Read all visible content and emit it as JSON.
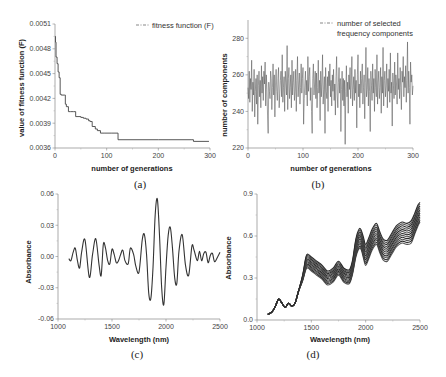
{
  "chart_data": [
    {
      "id": "a",
      "type": "line",
      "caption": "(a)",
      "xlabel": "number of generations",
      "ylabel": "value of fitness function (F)",
      "legend": "fitness function (F)",
      "xlim": [
        0,
        300
      ],
      "ylim": [
        0.0036,
        0.0051
      ],
      "xticks": [
        0,
        100,
        200,
        300
      ],
      "yticks": [
        0.0036,
        0.0039,
        0.0042,
        0.0045,
        0.0048,
        0.0051
      ],
      "ytick_labels": [
        "0.0036",
        "0.0039",
        "0.0042",
        "0.0045",
        "0.0048",
        "0.0051"
      ],
      "x": [
        0,
        1,
        2,
        4,
        6,
        8,
        10,
        12,
        18,
        20,
        22,
        26,
        30,
        36,
        40,
        50,
        55,
        60,
        65,
        68,
        72,
        78,
        82,
        88,
        95,
        110,
        120,
        122,
        200,
        265,
        268,
        298
      ],
      "y": [
        0.00495,
        0.00488,
        0.0047,
        0.00462,
        0.00452,
        0.00445,
        0.00425,
        0.00424,
        0.00424,
        0.00413,
        0.0041,
        0.00404,
        0.00404,
        0.00404,
        0.00398,
        0.00397,
        0.00396,
        0.00395,
        0.00393,
        0.00392,
        0.00386,
        0.00383,
        0.00381,
        0.00378,
        0.00378,
        0.00378,
        0.00378,
        0.0037,
        0.0037,
        0.0037,
        0.00368,
        0.00368
      ],
      "step": true,
      "grid": false,
      "legend_position": "upper right"
    },
    {
      "id": "b",
      "type": "line",
      "caption": "(b)",
      "xlabel": "number of generations",
      "ylabel": "number of components",
      "legend": "number of selected frequency components",
      "legend_lines": [
        "number of selected",
        "frequency components"
      ],
      "xlim": [
        0,
        300
      ],
      "ylim": [
        220,
        290
      ],
      "xticks": [
        0,
        100,
        200,
        300
      ],
      "yticks": [
        220,
        240,
        260,
        280
      ],
      "x_range": [
        0,
        300
      ],
      "y_range_observed": [
        222,
        278
      ],
      "mean_approx": 252,
      "values": [
        253,
        247,
        262,
        245,
        258,
        252,
        268,
        240,
        256,
        249,
        263,
        237,
        251,
        258,
        244,
        260,
        233,
        254,
        262,
        248,
        257,
        242,
        265,
        250,
        259,
        246,
        262,
        255,
        267,
        243,
        260,
        252,
        238,
        228,
        256,
        251,
        247,
        262,
        258,
        241,
        253,
        266,
        249,
        260,
        237,
        255,
        263,
        251,
        246,
        258,
        264,
        242,
        250,
        257,
        262,
        248,
        271,
        245,
        253,
        259,
        240,
        262,
        256,
        249,
        276,
        241,
        258,
        264,
        247,
        253,
        260,
        242,
        268,
        249,
        256,
        262,
        246,
        251,
        263,
        240,
        257,
        270,
        248,
        255,
        261,
        244,
        253,
        266,
        250,
        258,
        264,
        233,
        247,
        255,
        262,
        249,
        257,
        243,
        270,
        251,
        259,
        264,
        246,
        253,
        240,
        228,
        258,
        266,
        249,
        255,
        262,
        247,
        261,
        242,
        253,
        268,
        250,
        257,
        235,
        262,
        248,
        256,
        271,
        244,
        252,
        259,
        228,
        264,
        251,
        247,
        259,
        240,
        262,
        254,
        266,
        248,
        257,
        243,
        260,
        251,
        263,
        246,
        255,
        238,
        259,
        270,
        249,
        242,
        256,
        264,
        250,
        258,
        229,
        252,
        262,
        246,
        258,
        243,
        257,
        222,
        251,
        265,
        248,
        256,
        239,
        260,
        252,
        264,
        247,
        255,
        270,
        243,
        252,
        259,
        246,
        263,
        250,
        257,
        231,
        260,
        271,
        248,
        255,
        242,
        262,
        250,
        258,
        266,
        244,
        253,
        260,
        236,
        256,
        275,
        248,
        252,
        264,
        243,
        258,
        251,
        229,
        262,
        254,
        246,
        266,
        250,
        258,
        240,
        263,
        253,
        248,
        271,
        244,
        256,
        262,
        247,
        253,
        264,
        239,
        259,
        250,
        275,
        243,
        257,
        262,
        248,
        254,
        266,
        242,
        258,
        251,
        263,
        245,
        272,
        250,
        256,
        232,
        261,
        254,
        247,
        267,
        249,
        260,
        255,
        244,
        272,
        252,
        258,
        247,
        264,
        253,
        241,
        262,
        256,
        270,
        248,
        259,
        253,
        265,
        245,
        257,
        278,
        250,
        262,
        253,
        233,
        267,
        256,
        260,
        249,
        254
      ]
    },
    {
      "id": "c",
      "type": "line",
      "caption": "(c)",
      "xlabel": "Wavelength (nm)",
      "ylabel": "Absorbance",
      "xlim": [
        1000,
        2500
      ],
      "ylim": [
        -0.06,
        0.06
      ],
      "xticks": [
        1000,
        1500,
        2000,
        2500
      ],
      "yticks": [
        -0.06,
        -0.03,
        0.0,
        0.03,
        0.06
      ],
      "ytick_labels": [
        "-0.06",
        "-0.03",
        "0.00",
        "0.03",
        "0.06"
      ],
      "x": [
        1100,
        1120,
        1140,
        1160,
        1180,
        1200,
        1220,
        1250,
        1290,
        1320,
        1350,
        1380,
        1400,
        1420,
        1440,
        1460,
        1480,
        1500,
        1520,
        1540,
        1560,
        1580,
        1600,
        1620,
        1650,
        1670,
        1700,
        1720,
        1750,
        1780,
        1800,
        1820,
        1840,
        1860,
        1880,
        1900,
        1920,
        1940,
        1960,
        1980,
        2000,
        2020,
        2040,
        2060,
        2080,
        2100,
        2120,
        2150,
        2180,
        2210,
        2240,
        2260,
        2290,
        2310,
        2330,
        2350,
        2370,
        2390,
        2410,
        2430,
        2450,
        2480,
        2500
      ],
      "y": [
        -0.002,
        -0.004,
        0.004,
        0.008,
        -0.004,
        -0.011,
        0.005,
        0.016,
        -0.02,
        0.002,
        0.017,
        -0.008,
        -0.018,
        0.012,
        0.008,
        -0.004,
        -0.007,
        0.007,
        0.002,
        -0.006,
        -0.004,
        0.002,
        0.006,
        -0.004,
        -0.007,
        0.008,
        0.002,
        -0.009,
        -0.015,
        0.016,
        0.021,
        0.002,
        -0.035,
        -0.04,
        -0.01,
        0.04,
        0.055,
        0.02,
        -0.03,
        -0.046,
        -0.01,
        0.02,
        0.028,
        0.008,
        -0.02,
        -0.026,
        0.005,
        0.021,
        -0.008,
        -0.018,
        0.01,
        0.006,
        -0.004,
        0.005,
        -0.004,
        0.003,
        0.004,
        -0.006,
        0.001,
        0.003,
        -0.005,
        0.0,
        0.004
      ]
    },
    {
      "id": "d",
      "type": "line",
      "caption": "(d)",
      "xlabel": "Wavelength (nm)",
      "ylabel": "Absorbance",
      "xlim": [
        1000,
        2500
      ],
      "ylim": [
        0.0,
        0.9
      ],
      "xticks": [
        1000,
        1500,
        2000,
        2500
      ],
      "yticks": [
        0.0,
        0.3,
        0.6,
        0.9
      ],
      "ytick_labels": [
        "0.0",
        "0.3",
        "0.6",
        "0.9"
      ],
      "series_count_approx": 12,
      "x": [
        1100,
        1140,
        1170,
        1200,
        1230,
        1260,
        1290,
        1320,
        1350,
        1380,
        1420,
        1450,
        1470,
        1500,
        1550,
        1600,
        1650,
        1700,
        1750,
        1800,
        1850,
        1880,
        1910,
        1940,
        1960,
        1980,
        2000,
        2030,
        2060,
        2100,
        2130,
        2160,
        2200,
        2240,
        2280,
        2310,
        2340,
        2380,
        2420,
        2450,
        2480,
        2500
      ],
      "base": [
        0.04,
        0.06,
        0.1,
        0.15,
        0.12,
        0.09,
        0.12,
        0.1,
        0.12,
        0.2,
        0.3,
        0.4,
        0.42,
        0.4,
        0.37,
        0.34,
        0.3,
        0.32,
        0.37,
        0.32,
        0.31,
        0.38,
        0.52,
        0.58,
        0.57,
        0.52,
        0.47,
        0.52,
        0.58,
        0.62,
        0.56,
        0.51,
        0.5,
        0.55,
        0.6,
        0.62,
        0.63,
        0.62,
        0.64,
        0.7,
        0.76,
        0.79
      ],
      "spread_low": [
        0,
        0,
        0,
        0,
        0,
        0,
        0,
        0,
        0,
        0,
        -0.02,
        -0.04,
        -0.05,
        -0.05,
        -0.05,
        -0.05,
        -0.05,
        -0.05,
        -0.05,
        -0.05,
        -0.05,
        -0.05,
        -0.07,
        -0.07,
        -0.07,
        -0.08,
        -0.08,
        -0.08,
        -0.08,
        -0.08,
        -0.08,
        -0.08,
        -0.08,
        -0.08,
        -0.08,
        -0.08,
        -0.08,
        -0.08,
        -0.09,
        -0.09,
        -0.09,
        -0.09
      ],
      "spread_high": [
        0,
        0,
        0,
        0,
        0,
        0,
        0,
        0,
        0,
        0,
        0.02,
        0.05,
        0.05,
        0.05,
        0.05,
        0.05,
        0.05,
        0.05,
        0.05,
        0.05,
        0.05,
        0.05,
        0.06,
        0.07,
        0.07,
        0.07,
        0.07,
        0.07,
        0.07,
        0.07,
        0.07,
        0.07,
        0.07,
        0.07,
        0.07,
        0.07,
        0.07,
        0.07,
        0.07,
        0.06,
        0.06,
        0.05
      ]
    }
  ]
}
